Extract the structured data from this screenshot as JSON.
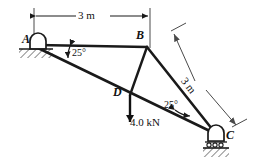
{
  "figure": {
    "stroke_color": "#1a1a1a",
    "dimension_color": "#4a4a4a",
    "background": "#ffffff"
  },
  "nodes": [
    {
      "id": "A",
      "label": "A",
      "x": 38,
      "y": 45,
      "support": "pin"
    },
    {
      "id": "B",
      "label": "B",
      "x": 147,
      "y": 47,
      "support": "none"
    },
    {
      "id": "C",
      "label": "C",
      "x": 216,
      "y": 134,
      "support": "roller"
    },
    {
      "id": "D",
      "label": "D",
      "x": 130,
      "y": 95,
      "support": "none"
    }
  ],
  "members": [
    {
      "id": "AB",
      "from": "A",
      "to": "B"
    },
    {
      "id": "AC",
      "from": "A",
      "to": "C"
    },
    {
      "id": "BC",
      "from": "B",
      "to": "C"
    },
    {
      "id": "BD",
      "from": "B",
      "to": "D"
    }
  ],
  "dimensions": [
    {
      "id": "AB-length",
      "label": "3 m",
      "from": "A",
      "to": "B",
      "orientation": "horizontal"
    },
    {
      "id": "BC-length",
      "label": "3 m",
      "from": "B",
      "to": "C",
      "orientation": "diagonal"
    }
  ],
  "angles": [
    {
      "id": "angle-at-A",
      "label": "25°",
      "vertex": "A",
      "between": [
        "AB",
        "AC"
      ]
    },
    {
      "id": "angle-at-C",
      "label": "25°",
      "vertex": "C",
      "between": [
        "CA",
        "CB"
      ]
    }
  ],
  "loads": [
    {
      "id": "load-D",
      "label": "4.0 kN",
      "magnitude": "4.0",
      "unit": "kN",
      "at": "D",
      "direction": "down"
    }
  ]
}
